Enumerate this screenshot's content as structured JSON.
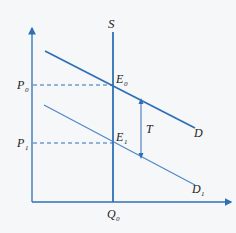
{
  "diagram": {
    "type": "supply-demand-tax-shift",
    "colors": {
      "line": "#2f6fb5",
      "light_line": "#4a86c5",
      "text": "#222222",
      "background": "#f6f7f9"
    },
    "labels": {
      "supply": "S",
      "demand": "D",
      "demand_shifted": "D",
      "demand_shifted_sub": "1",
      "e0": "E",
      "e0_sub": "0",
      "e1": "E",
      "e1_sub": "1",
      "p0": "P",
      "p0_sub": "0",
      "p1": "P",
      "p1_sub": "1",
      "q0": "Q",
      "q0_sub": "0",
      "tax": "T"
    }
  }
}
